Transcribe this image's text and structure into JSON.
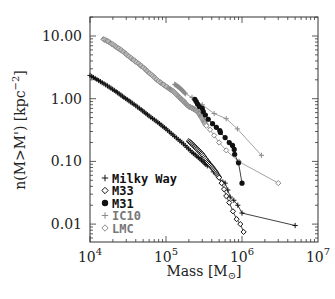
{
  "chart_data": {
    "type": "scatter",
    "title": "",
    "xlabel": "Mass [M_sun]",
    "ylabel": "n(M>M') [kpc^-2]",
    "xscale": "log",
    "yscale": "log",
    "xlim": [
      10000,
      10000000
    ],
    "ylim": [
      0.0055,
      22
    ],
    "grid": false,
    "legend_position": "lower left",
    "x_ticks": [
      {
        "value": 10000,
        "base": "10",
        "exp": "4"
      },
      {
        "value": 100000,
        "base": "10",
        "exp": "5"
      },
      {
        "value": 1000000,
        "base": "10",
        "exp": "6"
      },
      {
        "value": 10000000,
        "base": "10",
        "exp": "7"
      }
    ],
    "y_ticks": [
      {
        "value": 10,
        "label": "10.00"
      },
      {
        "value": 1,
        "label": "1.00"
      },
      {
        "value": 0.1,
        "label": "0.10"
      },
      {
        "value": 0.01,
        "label": "0.01"
      }
    ],
    "series": [
      {
        "name": "Milky Way",
        "marker": "plus",
        "color": "#111111",
        "line": true,
        "dense_until_index": 14,
        "points": [
          [
            10000,
            2.35
          ],
          [
            13000,
            1.95
          ],
          [
            17000,
            1.6
          ],
          [
            22000,
            1.3
          ],
          [
            28000,
            1.05
          ],
          [
            36000,
            0.85
          ],
          [
            47000,
            0.67
          ],
          [
            60000,
            0.53
          ],
          [
            78000,
            0.42
          ],
          [
            100000,
            0.33
          ],
          [
            130000,
            0.25
          ],
          [
            170000,
            0.19
          ],
          [
            220000,
            0.14
          ],
          [
            280000,
            0.11
          ],
          [
            350000,
            0.085
          ],
          [
            420000,
            0.068
          ],
          [
            500000,
            0.055
          ],
          [
            560000,
            0.047
          ],
          [
            600000,
            0.045
          ],
          [
            650000,
            0.035
          ],
          [
            700000,
            0.027
          ],
          [
            780000,
            0.024
          ],
          [
            880000,
            0.02
          ],
          [
            1000000,
            0.015
          ],
          [
            5000000,
            0.0095
          ]
        ]
      },
      {
        "name": "M33",
        "marker": "diamond-open",
        "color": "#111111",
        "line": true,
        "dense_until_index": 7,
        "points": [
          [
            200000,
            0.21
          ],
          [
            230000,
            0.18
          ],
          [
            260000,
            0.155
          ],
          [
            300000,
            0.13
          ],
          [
            350000,
            0.1
          ],
          [
            400000,
            0.082
          ],
          [
            450000,
            0.068
          ],
          [
            500000,
            0.055
          ],
          [
            540000,
            0.045
          ],
          [
            580000,
            0.036
          ],
          [
            620000,
            0.028
          ],
          [
            680000,
            0.022
          ],
          [
            760000,
            0.016
          ],
          [
            850000,
            0.012
          ],
          [
            950000,
            0.01
          ],
          [
            1050000,
            0.0075
          ]
        ]
      },
      {
        "name": "M31",
        "marker": "circle-filled",
        "color": "#111111",
        "line": true,
        "dense_until_index": 0,
        "points": [
          [
            240000,
            0.98
          ],
          [
            250000,
            0.9
          ],
          [
            260000,
            0.82
          ],
          [
            275000,
            0.75
          ],
          [
            300000,
            0.7
          ],
          [
            310000,
            0.62
          ],
          [
            330000,
            0.55
          ],
          [
            360000,
            0.47
          ],
          [
            410000,
            0.4
          ],
          [
            460000,
            0.35
          ],
          [
            510000,
            0.31
          ],
          [
            520000,
            0.29
          ],
          [
            600000,
            0.24
          ],
          [
            680000,
            0.2
          ],
          [
            750000,
            0.18
          ],
          [
            790000,
            0.155
          ],
          [
            800000,
            0.13
          ],
          [
            900000,
            0.095
          ],
          [
            1000000,
            0.045
          ]
        ]
      },
      {
        "name": "IC10",
        "marker": "plus",
        "color": "#8a8a8a",
        "line": true,
        "dense_until_index": 3,
        "points": [
          [
            130000,
            1.7
          ],
          [
            145000,
            1.55
          ],
          [
            160000,
            1.4
          ],
          [
            180000,
            1.2
          ],
          [
            220000,
            1.05
          ],
          [
            300000,
            0.8
          ],
          [
            430000,
            0.58
          ],
          [
            620000,
            0.48
          ],
          [
            870000,
            0.33
          ],
          [
            1800000,
            0.125
          ]
        ]
      },
      {
        "name": "LMC",
        "marker": "diamond-open",
        "color": "#8a8a8a",
        "line": true,
        "dense_until_index": 36,
        "points": [
          [
            15000,
            8.9
          ],
          [
            17000,
            8.3
          ],
          [
            19000,
            7.6
          ],
          [
            21000,
            7.0
          ],
          [
            23000,
            6.5
          ],
          [
            26000,
            5.9
          ],
          [
            29000,
            5.3
          ],
          [
            32000,
            4.8
          ],
          [
            36000,
            4.3
          ],
          [
            40000,
            3.9
          ],
          [
            45000,
            3.5
          ],
          [
            50000,
            3.15
          ],
          [
            56000,
            2.8
          ],
          [
            62000,
            2.5
          ],
          [
            70000,
            2.2
          ],
          [
            78000,
            1.95
          ],
          [
            88000,
            1.75
          ],
          [
            98000,
            1.6
          ],
          [
            110000,
            1.45
          ],
          [
            120000,
            1.35
          ],
          [
            130000,
            1.25
          ],
          [
            140000,
            1.15
          ],
          [
            150000,
            1.05
          ],
          [
            160000,
            0.98
          ],
          [
            170000,
            0.92
          ],
          [
            180000,
            0.85
          ],
          [
            190000,
            0.8
          ],
          [
            200000,
            0.75
          ],
          [
            215000,
            0.72
          ],
          [
            230000,
            0.69
          ],
          [
            245000,
            0.66
          ],
          [
            260000,
            0.62
          ],
          [
            275000,
            0.57
          ],
          [
            290000,
            0.52
          ],
          [
            305000,
            0.47
          ],
          [
            320000,
            0.42
          ],
          [
            340000,
            0.37
          ],
          [
            380000,
            0.32
          ],
          [
            430000,
            0.26
          ],
          [
            500000,
            0.2
          ],
          [
            620000,
            0.15
          ],
          [
            900000,
            0.1
          ],
          [
            3000000,
            0.045
          ]
        ]
      }
    ]
  }
}
